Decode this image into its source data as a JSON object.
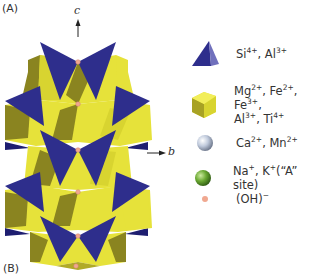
{
  "figure": {
    "panel_a_label": "(A)",
    "panel_b_label": "(B)",
    "axes": {
      "c_label": "c",
      "b_label": "b"
    },
    "colors": {
      "tetrahedron": "#2e2e8c",
      "tetrahedron_light": "#6a6ab8",
      "octahedron": "#e6e23a",
      "octahedron_shade": "#8a8420",
      "ca_mn_sphere": "#b8c4d8",
      "na_k_sphere": "#5e9a2c",
      "oh_sphere": "#f0a890"
    },
    "legend": [
      {
        "shape": "tetrahedron-icon",
        "text_parts": [
          "Si",
          "4+",
          ", Al",
          "3+"
        ]
      },
      {
        "shape": "octahedron-icon",
        "line1": [
          "Mg",
          "2+",
          ", Fe",
          "2+",
          ", Fe",
          "3+",
          ","
        ],
        "line2": [
          "Al",
          "3+",
          ", Ti",
          "4+"
        ]
      },
      {
        "shape": "ca-mn-sphere-icon",
        "text_parts": [
          "Ca",
          "2+",
          ", Mn",
          "2+"
        ]
      },
      {
        "shape": "na-k-sphere-icon",
        "text_parts": [
          "Na",
          "+",
          ", K",
          "+",
          "(“A” site)"
        ]
      },
      {
        "shape": "oh-sphere-icon",
        "text_parts": [
          "(OH)",
          "−"
        ]
      }
    ]
  }
}
